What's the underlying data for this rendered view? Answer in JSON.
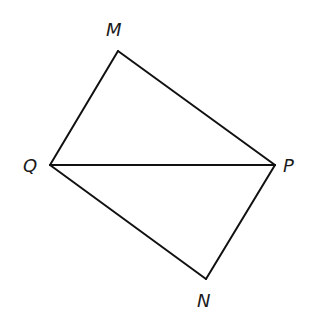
{
  "diagram": {
    "type": "geometry",
    "shape": "quadrilateral QMPN with diagonal QP",
    "stroke_color": "#111111",
    "vertices": [
      {
        "name": "M",
        "label": "M",
        "x": 118,
        "y": 51,
        "label_x": 106,
        "label_y": 36
      },
      {
        "name": "Q",
        "label": "Q",
        "x": 50,
        "y": 165,
        "label_x": 23,
        "label_y": 172
      },
      {
        "name": "P",
        "label": "P",
        "x": 275,
        "y": 165,
        "label_x": 283,
        "label_y": 172
      },
      {
        "name": "N",
        "label": "N",
        "x": 206,
        "y": 279,
        "label_x": 197,
        "label_y": 307
      }
    ],
    "segments": [
      {
        "name": "QM",
        "from": "Q",
        "to": "M"
      },
      {
        "name": "MP",
        "from": "M",
        "to": "P"
      },
      {
        "name": "QP",
        "from": "Q",
        "to": "P"
      },
      {
        "name": "QN",
        "from": "Q",
        "to": "N"
      },
      {
        "name": "NP",
        "from": "N",
        "to": "P"
      }
    ]
  }
}
